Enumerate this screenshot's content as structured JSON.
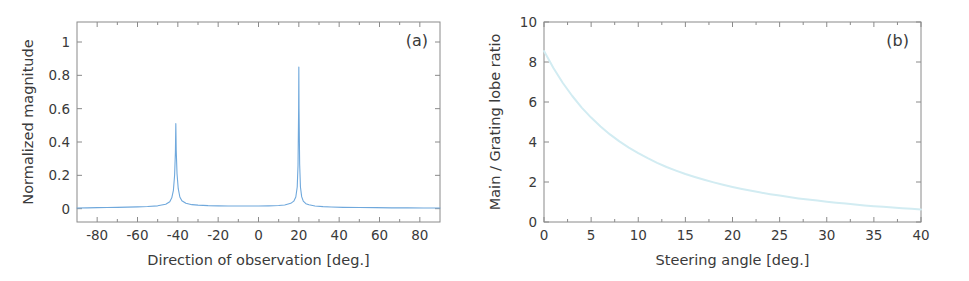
{
  "figure": {
    "background": "#ffffff",
    "axis_color": "#8a8a8a",
    "text_color": "#3a3a3a"
  },
  "chart_data": [
    {
      "id": "panel-a",
      "type": "line",
      "panel_label": "(a)",
      "title": "",
      "xlabel": "Direction of observation [deg.]",
      "ylabel": "Normalized magnitude",
      "xlim": [
        -90,
        90
      ],
      "ylim": [
        -0.08,
        1.12
      ],
      "xticks": [
        -80,
        -60,
        -40,
        -20,
        0,
        20,
        40,
        60,
        80
      ],
      "xticklabels": [
        "-80",
        "-60",
        "-40",
        "-20",
        "0",
        "20",
        "40",
        "60",
        "80"
      ],
      "yticks": [
        0,
        0.2,
        0.4,
        0.6,
        0.8,
        1
      ],
      "yticklabels": [
        "0",
        "0.2",
        "0.4",
        "0.6",
        "0.8",
        "1"
      ],
      "grid": false,
      "legend": "none",
      "line_color": "#6fa8dc",
      "series": [
        {
          "name": "array beam pattern",
          "main_lobe_angle_deg": 20,
          "main_lobe_peak": 0.85,
          "grating_lobe_angle_deg": -41,
          "grating_lobe_peak": 0.51,
          "sidelobe_pedestal_level": 0.02,
          "baseline": 0.0,
          "x": [
            -90,
            -85,
            -80,
            -75,
            -70,
            -65,
            -60,
            -55,
            -50,
            -46,
            -44,
            -43,
            -42.2,
            -41.6,
            -41.2,
            -41,
            -40.8,
            -40.4,
            -39.8,
            -39,
            -38,
            -36,
            -33,
            -30,
            -25,
            -20,
            -15,
            -10,
            -5,
            0,
            5,
            10,
            13,
            16,
            17.5,
            18.5,
            19.2,
            19.6,
            19.9,
            20,
            20.1,
            20.4,
            20.8,
            21.4,
            22.2,
            23.5,
            25,
            28,
            32,
            36,
            42,
            50,
            58,
            66,
            74,
            82,
            90
          ],
          "y": [
            0.004,
            0.005,
            0.006,
            0.007,
            0.008,
            0.009,
            0.011,
            0.013,
            0.017,
            0.027,
            0.042,
            0.065,
            0.11,
            0.2,
            0.34,
            0.51,
            0.35,
            0.21,
            0.12,
            0.07,
            0.048,
            0.032,
            0.024,
            0.021,
            0.018,
            0.017,
            0.016,
            0.016,
            0.016,
            0.016,
            0.017,
            0.019,
            0.022,
            0.032,
            0.045,
            0.07,
            0.13,
            0.26,
            0.6,
            0.85,
            0.6,
            0.27,
            0.13,
            0.072,
            0.045,
            0.03,
            0.023,
            0.016,
            0.012,
            0.01,
            0.008,
            0.007,
            0.006,
            0.005,
            0.005,
            0.004,
            0.004
          ]
        }
      ]
    },
    {
      "id": "panel-b",
      "type": "line",
      "panel_label": "(b)",
      "title": "",
      "xlabel": "Steering angle [deg.]",
      "ylabel": "Main / Grating lobe ratio",
      "xlim": [
        0,
        40
      ],
      "ylim": [
        0,
        10
      ],
      "xticks": [
        0,
        5,
        10,
        15,
        20,
        25,
        30,
        35,
        40
      ],
      "xticklabels": [
        "0",
        "5",
        "10",
        "15",
        "20",
        "25",
        "30",
        "35",
        "40"
      ],
      "yticks": [
        0,
        2,
        4,
        6,
        8,
        10
      ],
      "yticklabels": [
        "0",
        "2",
        "4",
        "6",
        "8",
        "10"
      ],
      "grid": false,
      "legend": "none",
      "line_color": "#d2ecf2",
      "series": [
        {
          "name": "main-to-grating lobe ratio",
          "x": [
            0,
            1,
            2,
            3,
            4,
            5,
            6,
            7,
            8,
            9,
            10,
            11,
            12,
            13,
            14,
            15,
            16,
            17,
            18,
            19,
            20,
            21,
            22,
            23,
            24,
            25,
            26,
            27,
            28,
            29,
            30,
            31,
            32,
            33,
            34,
            35,
            36,
            37,
            38,
            39,
            40
          ],
          "y": [
            8.55,
            7.7,
            6.95,
            6.3,
            5.72,
            5.22,
            4.78,
            4.38,
            4.03,
            3.72,
            3.44,
            3.19,
            2.96,
            2.75,
            2.57,
            2.4,
            2.25,
            2.11,
            1.98,
            1.86,
            1.75,
            1.65,
            1.56,
            1.47,
            1.39,
            1.32,
            1.25,
            1.18,
            1.12,
            1.07,
            1.01,
            0.96,
            0.92,
            0.87,
            0.83,
            0.79,
            0.76,
            0.72,
            0.69,
            0.66,
            0.63
          ]
        }
      ]
    }
  ]
}
